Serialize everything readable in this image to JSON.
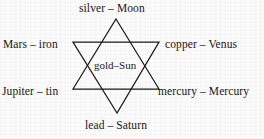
{
  "diagram": {
    "shape": "hexagram",
    "stroke_color": "#1a1a1a",
    "background_color": "#fbfbfb",
    "center": {
      "id": "center",
      "label": "gold–Sun",
      "metal": "gold",
      "planet": "Sun"
    },
    "points": [
      {
        "id": "top",
        "position": "top",
        "label": "silver – Moon",
        "metal": "silver",
        "planet": "Moon"
      },
      {
        "id": "left-upper",
        "position": "upper-left",
        "label": "Mars – iron",
        "metal": "iron",
        "planet": "Mars"
      },
      {
        "id": "right-upper",
        "position": "upper-right",
        "label": "copper – Venus",
        "metal": "copper",
        "planet": "Venus"
      },
      {
        "id": "left-lower",
        "position": "lower-left",
        "label": "Jupiter – tin",
        "metal": "tin",
        "planet": "Jupiter"
      },
      {
        "id": "right-lower",
        "position": "lower-right",
        "label": "mercury – Mercury",
        "metal": "mercury",
        "planet": "Mercury"
      },
      {
        "id": "bottom",
        "position": "bottom",
        "label": "lead – Saturn",
        "metal": "lead",
        "planet": "Saturn"
      }
    ]
  }
}
